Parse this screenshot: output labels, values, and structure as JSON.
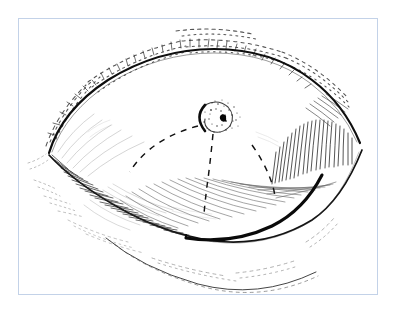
{
  "figure": {
    "domain": "medical-illustration",
    "title": "Eyelid lesion surgical planning diagram",
    "style": "black ink pen-and-hatch line drawing on white ground",
    "frame": {
      "border_color": "#c3d2e8",
      "border_width_px": 1,
      "x": 18,
      "y": 18,
      "width": 360,
      "height": 277,
      "background": "#ffffff"
    },
    "ink": {
      "primary_color": "#111111",
      "hatch_color": "#3a3a3a",
      "light_hatch_color": "#6a6a6a",
      "stipple_color": "#2a2a2a",
      "dashed_color": "#1a1a1a"
    },
    "parts": [
      {
        "name": "upper-lid-margin",
        "label": "Upper eyelid margin",
        "stroke_weight": "heavy",
        "description": "Bold arc sweeping from medial canthus up over the globe to lateral canthus"
      },
      {
        "name": "upper-lid-crease",
        "label": "Supratarsal crease with lash stippling",
        "stroke_weight": "fine-stipple",
        "description": "Broken dashed and stippled band paralleling the upper lid above the bold margin"
      },
      {
        "name": "lower-lid-margin",
        "label": "Lower eyelid margin",
        "stroke_weight": "medium",
        "description": "Curve running from medial canthus down and out to lateral canthus"
      },
      {
        "name": "lower-lid-hatching",
        "label": "Lower lid shading hatch",
        "stroke_weight": "fine",
        "description": "Dense oblique hatch lines filling the infero-temporal lid surface"
      },
      {
        "name": "lateral-canthus-hatching",
        "label": "Lateral canthal fan hatch",
        "stroke_weight": "fine",
        "description": "Near-vertical fan of short strokes converging on the lateral canthus"
      },
      {
        "name": "medial-canthus",
        "label": "Medial canthus",
        "stroke_weight": "medium",
        "description": "Pointed junction of upper and lower lid at the nasal side"
      },
      {
        "name": "lateral-canthus",
        "label": "Lateral canthus",
        "stroke_weight": "medium",
        "description": "Pointed junction of upper and lower lid at the temporal side"
      },
      {
        "name": "cheek-fold",
        "label": "Infraorbital cheek fold",
        "stroke_weight": "fine",
        "description": "Long shallow curve with dashes below the lower lid"
      },
      {
        "name": "lesion",
        "label": "Lesion",
        "stroke_weight": "heavy-crescent-plus-stipple",
        "description": "Small oval with a dark crescent on its nasal edge, stippled halo, and a dark central punctum",
        "center": {
          "x": 215,
          "y": 117
        },
        "radius_x": 15,
        "radius_y": 13
      },
      {
        "name": "dashed-excision-line-medial",
        "label": "Planned incision, medial arc",
        "stroke_weight": "dashed",
        "description": "Dashed curve arcing from the lesion down and to the nasal side"
      },
      {
        "name": "dashed-excision-line-central",
        "label": "Planned incision, central limb",
        "stroke_weight": "dashed",
        "description": "Dashed near-vertical line dropping from the lesion toward the lower lid"
      },
      {
        "name": "dashed-excision-line-lateral",
        "label": "Planned incision, lateral arc",
        "stroke_weight": "dashed",
        "description": "Dashed curve arcing from the lesion down and to the temporal side"
      },
      {
        "name": "bold-incision-arc",
        "label": "Subciliary incision marking",
        "stroke_weight": "bold",
        "description": "Thick solid arc along the lower lid running infero-medially then up to the lateral canthus"
      }
    ],
    "annotations": [],
    "caption": ""
  }
}
